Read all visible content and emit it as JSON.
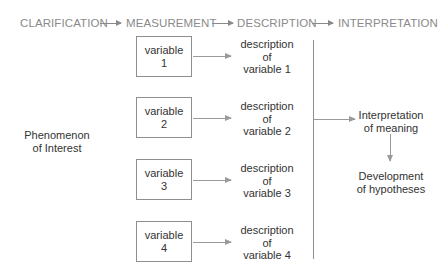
{
  "header": {
    "stages": [
      "CLARIFICATION",
      "MEASUREMENT",
      "DESCRIPTION",
      "INTERPRETATION"
    ],
    "color": "#8a8a8a"
  },
  "phenomenon": {
    "line1": "Phenomenon",
    "line2": "of Interest"
  },
  "variables": [
    {
      "line1": "variable",
      "line2": "1",
      "desc1": "description",
      "desc2": "of",
      "desc3": "variable 1"
    },
    {
      "line1": "variable",
      "line2": "2",
      "desc1": "description",
      "desc2": "of",
      "desc3": "variable 2"
    },
    {
      "line1": "variable",
      "line2": "3",
      "desc1": "description",
      "desc2": "of",
      "desc3": "variable 3"
    },
    {
      "line1": "variable",
      "line2": "4",
      "desc1": "description",
      "desc2": "of",
      "desc3": "variable 4"
    }
  ],
  "interpretation": {
    "line1": "Interpretation",
    "line2": "of meaning"
  },
  "development": {
    "line1": "Development",
    "line2": "of hypotheses"
  }
}
